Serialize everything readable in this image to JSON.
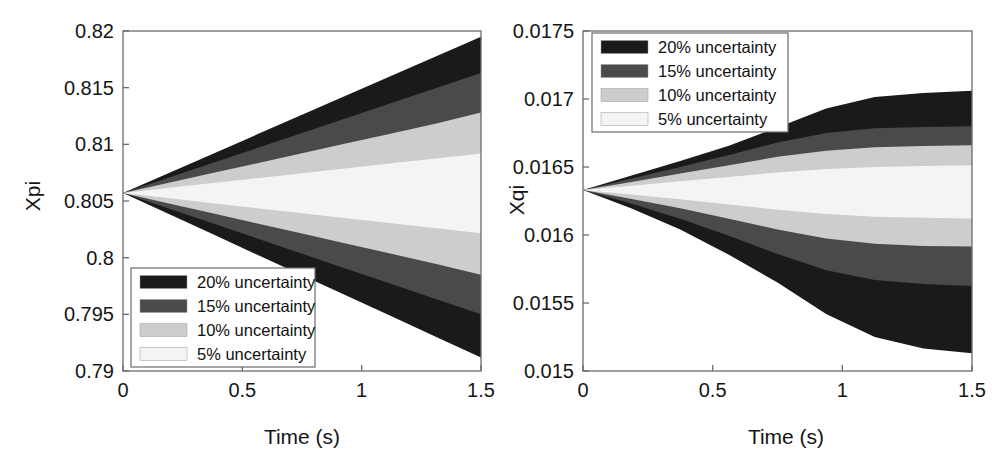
{
  "figure": {
    "panel_count": 2,
    "background": "#ffffff",
    "axis_color": "#6b6b6b",
    "text_color": "#151515"
  },
  "legend_colors": {
    "u20": "#1a1a1a",
    "u15": "#4a4a4a",
    "u10": "#cdcdcd",
    "u5": "#f4f4f4"
  },
  "legend": {
    "entries": [
      {
        "label": "20% uncertainty",
        "color": "#1a1a1a",
        "key": "u20"
      },
      {
        "label": "15% uncertainty",
        "color": "#4a4a4a",
        "key": "u15"
      },
      {
        "label": "10% uncertainty",
        "color": "#cdcdcd",
        "key": "u10"
      },
      {
        "label": "5% uncertainty",
        "color": "#f4f4f4",
        "key": "u5"
      }
    ]
  },
  "chart_data": [
    {
      "type": "area",
      "panel": "left",
      "title": "",
      "xlabel": "Time (s)",
      "ylabel": "Xpi",
      "xlim": [
        0,
        1.5
      ],
      "ylim": [
        0.79,
        0.82
      ],
      "grid": false,
      "legend_position": "lower-left",
      "xticks": [
        0,
        0.5,
        1,
        1.5
      ],
      "xtick_labels": [
        "0",
        "0.5",
        "1",
        "1.5"
      ],
      "yticks": [
        0.79,
        0.795,
        0.8,
        0.805,
        0.81,
        0.815,
        0.82
      ],
      "ytick_labels": [
        "0.79",
        "0.795",
        "0.8",
        "0.805",
        "0.81",
        "0.815",
        "0.82"
      ],
      "x": [
        0,
        0.1875,
        0.375,
        0.5625,
        0.75,
        0.9375,
        1.125,
        1.3125,
        1.5
      ],
      "nominal_start": 0.8057,
      "series": [
        {
          "name": "20% uncertainty",
          "color": "#1a1a1a",
          "upper": [
            0.8057,
            0.80742,
            0.80915,
            0.81088,
            0.8126,
            0.81433,
            0.81605,
            0.81778,
            0.8195
          ],
          "lower": [
            0.8057,
            0.80389,
            0.80208,
            0.80026,
            0.79845,
            0.79664,
            0.79482,
            0.79301,
            0.7912
          ]
        },
        {
          "name": "15% uncertainty",
          "color": "#4a4a4a",
          "upper": [
            0.8057,
            0.80703,
            0.80835,
            0.80968,
            0.811,
            0.81233,
            0.81365,
            0.81498,
            0.8163
          ],
          "lower": [
            0.8057,
            0.80436,
            0.80303,
            0.80169,
            0.80035,
            0.79901,
            0.79768,
            0.79634,
            0.795
          ]
        },
        {
          "name": "10% uncertainty",
          "color": "#cdcdcd",
          "upper": [
            0.8057,
            0.80658,
            0.80746,
            0.80833,
            0.80921,
            0.81009,
            0.81096,
            0.81184,
            0.8128
          ],
          "lower": [
            0.8057,
            0.80481,
            0.80391,
            0.80302,
            0.80213,
            0.80123,
            0.80034,
            0.79944,
            0.7985
          ]
        },
        {
          "name": "5% uncertainty",
          "color": "#f4f4f4",
          "upper": [
            0.8057,
            0.80614,
            0.80658,
            0.80701,
            0.80745,
            0.80789,
            0.80833,
            0.80876,
            0.8092
          ],
          "lower": [
            0.8057,
            0.80526,
            0.80481,
            0.80437,
            0.80393,
            0.80348,
            0.80304,
            0.80259,
            0.80215
          ]
        }
      ]
    },
    {
      "type": "area",
      "panel": "right",
      "title": "",
      "xlabel": "Time (s)",
      "ylabel": "Xqi",
      "xlim": [
        0,
        1.5
      ],
      "ylim": [
        0.015,
        0.0175
      ],
      "grid": false,
      "legend_position": "upper-left",
      "xticks": [
        0,
        0.5,
        1,
        1.5
      ],
      "xtick_labels": [
        "0",
        "0.5",
        "1",
        "1.5"
      ],
      "yticks": [
        0.015,
        0.0155,
        0.016,
        0.0165,
        0.017,
        0.0175
      ],
      "ytick_labels": [
        "0.015",
        "0.0155",
        "0.016",
        "0.0165",
        "0.017",
        "0.0175"
      ],
      "x": [
        0,
        0.1875,
        0.375,
        0.5625,
        0.75,
        0.9375,
        1.125,
        1.3125,
        1.5
      ],
      "nominal_start": 0.01633,
      "series": [
        {
          "name": "20% uncertainty",
          "color": "#1a1a1a",
          "upper": [
            0.01633,
            0.016437,
            0.016545,
            0.016657,
            0.01679,
            0.01693,
            0.017015,
            0.017045,
            0.01706
          ],
          "lower": [
            0.01633,
            0.016195,
            0.01604,
            0.015855,
            0.01565,
            0.01542,
            0.01525,
            0.015165,
            0.01513
          ]
        },
        {
          "name": "15% uncertainty",
          "color": "#4a4a4a",
          "upper": [
            0.01633,
            0.016415,
            0.0165,
            0.016588,
            0.01668,
            0.01675,
            0.016785,
            0.016795,
            0.0168
          ],
          "lower": [
            0.01633,
            0.01623,
            0.01612,
            0.015995,
            0.01586,
            0.01574,
            0.01567,
            0.01564,
            0.015625
          ]
        },
        {
          "name": "10% uncertainty",
          "color": "#cdcdcd",
          "upper": [
            0.01633,
            0.01639,
            0.016452,
            0.016513,
            0.016575,
            0.01662,
            0.016645,
            0.016655,
            0.01666
          ],
          "lower": [
            0.01633,
            0.016265,
            0.016196,
            0.01612,
            0.01604,
            0.015975,
            0.015935,
            0.01592,
            0.015915
          ]
        },
        {
          "name": "5% uncertainty",
          "color": "#f4f4f4",
          "upper": [
            0.01633,
            0.016362,
            0.016395,
            0.016427,
            0.01646,
            0.016485,
            0.0165,
            0.016508,
            0.016512
          ],
          "lower": [
            0.01633,
            0.016297,
            0.016262,
            0.016225,
            0.016186,
            0.016155,
            0.016135,
            0.016126,
            0.016122
          ]
        }
      ]
    }
  ]
}
